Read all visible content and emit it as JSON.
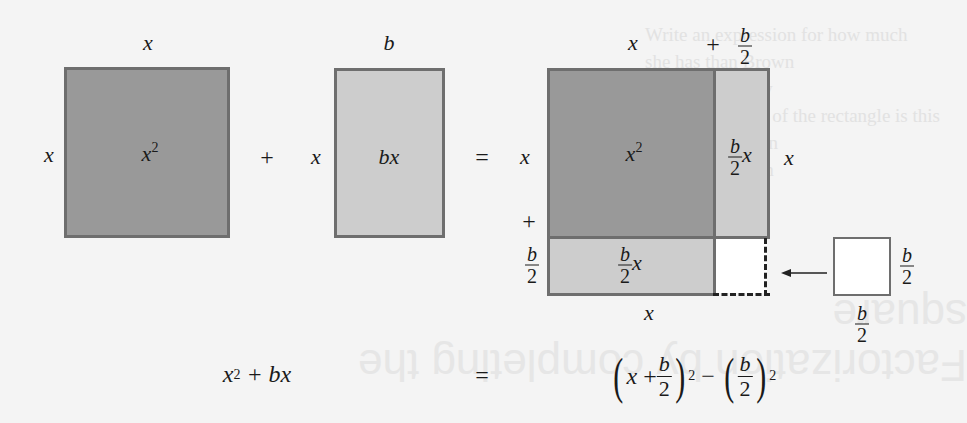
{
  "background_ghost": {
    "paragraph_lines": [
      "Write an expression for how much",
      "she has than Brown",
      "rise and simplify",
      "where the width of the rectangle is this",
      "more than Brown",
      "rmine how much",
      "on has"
    ],
    "heading": "Factorization by completing the square"
  },
  "left_diagram": {
    "square": {
      "top_label": "x",
      "side_label": "x",
      "area_label": "x",
      "area_exp": "2",
      "fill": "#999999"
    },
    "plus": "+",
    "rectangle": {
      "top_label": "b",
      "side_label": "x",
      "area_label": "bx",
      "fill": "#cdcdcd"
    }
  },
  "equals_top": "=",
  "right_diagram": {
    "top_x": "x",
    "top_plus": "+",
    "top_frac": {
      "num": "b",
      "den": "2"
    },
    "left_x": "x",
    "left_plus": "+",
    "left_frac": {
      "num": "b",
      "den": "2"
    },
    "right_x": "x",
    "bottom_x": "x",
    "big_square": {
      "label": "x",
      "exp": "2",
      "fill": "#999999"
    },
    "right_strip": {
      "frac": {
        "num": "b",
        "den": "2"
      },
      "var": "x",
      "fill": "#cdcdcd"
    },
    "bottom_strip": {
      "frac": {
        "num": "b",
        "den": "2"
      },
      "var": "x",
      "fill": "#cdcdcd"
    },
    "missing_corner": {
      "fill": "#ffffff",
      "border": "dashed"
    },
    "arrow": "←",
    "small_square": {
      "side_frac": {
        "num": "b",
        "den": "2"
      },
      "bottom_frac": {
        "num": "b",
        "den": "2"
      },
      "fill": "#ffffff"
    }
  },
  "bottom_equation": {
    "lhs": {
      "base": "x",
      "exp": "2",
      "rest": "+ bx"
    },
    "equals": "=",
    "rhs": {
      "term1": {
        "x": "x",
        "plus": "+",
        "frac": {
          "num": "b",
          "den": "2"
        },
        "exp": "2"
      },
      "minus": "−",
      "term2": {
        "frac": {
          "num": "b",
          "den": "2"
        },
        "exp": "2"
      }
    }
  },
  "colors": {
    "dark_fill": "#999999",
    "light_fill": "#cdcdcd",
    "stroke": "#6e6e6e",
    "background": "#f4f4f4"
  }
}
